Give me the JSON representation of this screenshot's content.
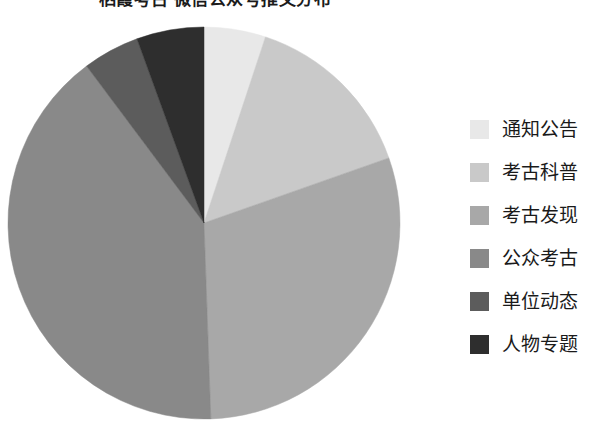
{
  "chart_data": {
    "type": "pie",
    "title": "栖霞考古 微信公众号推文分布",
    "categories": [
      "通知公告",
      "考古科普",
      "考古发现",
      "公众考古",
      "单位动态",
      "人物专题"
    ],
    "values": [
      5.1,
      14.5,
      29.8,
      40.3,
      4.7,
      5.6
    ],
    "colors": [
      "#e8e8e8",
      "#c9c9c9",
      "#a8a8a8",
      "#898989",
      "#5c5c5c",
      "#2e2e2e"
    ],
    "start_angle_deg": 0,
    "direction": "clockwise",
    "legend_position": "right",
    "grid": false,
    "xlabel": "",
    "ylabel": "",
    "slice_boundaries_deg": [
      0,
      18.3,
      70.6,
      178,
      323.2,
      340,
      360
    ],
    "geometry": {
      "cx": 197,
      "cy": 197,
      "r": 196
    }
  },
  "legend": {
    "items": [
      {
        "label": "通知公告",
        "color": "#e8e8e8"
      },
      {
        "label": "考古科普",
        "color": "#c9c9c9"
      },
      {
        "label": "考古发现",
        "color": "#a8a8a8"
      },
      {
        "label": "公众考古",
        "color": "#898989"
      },
      {
        "label": "单位动态",
        "color": "#5c5c5c"
      },
      {
        "label": "人物专题",
        "color": "#2e2e2e"
      }
    ]
  }
}
